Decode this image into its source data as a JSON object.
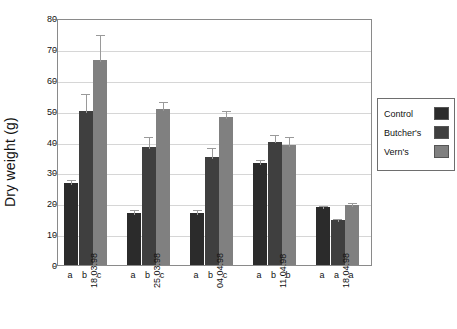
{
  "chart_data": {
    "type": "bar",
    "title": "",
    "xlabel": "",
    "ylabel": "Dry weight (g)",
    "ylim": [
      0,
      80
    ],
    "ytick_step": 10,
    "yticks": [
      "0",
      "10",
      "20",
      "30",
      "40",
      "50",
      "60",
      "70",
      "80"
    ],
    "grid": true,
    "legend_position": "right",
    "categories": [
      "18.03.98",
      "25.03.98",
      "04.04.98",
      "11.04.98",
      "18.04.98"
    ],
    "series": [
      {
        "name": "Control",
        "color": "#2b2b2b",
        "values": [
          26.5,
          16.8,
          16.8,
          33.0,
          18.7
        ],
        "errors": [
          1.6,
          1.6,
          1.6,
          1.6,
          1.0
        ]
      },
      {
        "name": "Butcher's",
        "color": "#3f3f3f",
        "values": [
          50.0,
          38.3,
          35.0,
          40.0,
          14.7
        ],
        "errors": [
          6.0,
          3.7,
          3.6,
          2.8,
          1.0
        ]
      },
      {
        "name": "Vern's",
        "color": "#808080",
        "values": [
          66.5,
          50.5,
          48.0,
          39.0,
          19.3
        ],
        "errors": [
          8.8,
          3.0,
          2.6,
          3.0,
          1.5
        ]
      }
    ],
    "significance_letters": [
      [
        "a",
        "b",
        "c"
      ],
      [
        "a",
        "b",
        "c"
      ],
      [
        "a",
        "b",
        "c"
      ],
      [
        "a",
        "b",
        "b"
      ],
      [
        "a",
        "a",
        "a"
      ]
    ],
    "legend_entries": [
      {
        "label": "Control",
        "color": "#2b2b2b"
      },
      {
        "label": "Butcher's",
        "color": "#3f3f3f"
      },
      {
        "label": "Vern's",
        "color": "#808080"
      }
    ]
  }
}
